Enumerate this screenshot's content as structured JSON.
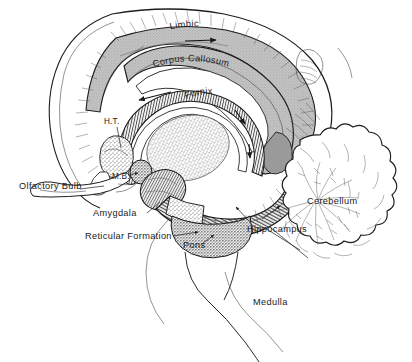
{
  "figure": {
    "background_color": "#ffffff",
    "ink_color": "#1a1a1a",
    "shade_color": "#b9b9b9",
    "width": 412,
    "height": 362
  },
  "labels": {
    "limbic": "Limbic",
    "corpus_callosum": "Corpus Callosum",
    "fornix": "Fornix",
    "ht": "H.T.",
    "mb": "M.B.",
    "olfactory_bulb": "Olfactory Bulb",
    "amygdala": "Amygdala",
    "reticular_formation": "Reticular Formation",
    "pons": "Pons",
    "hippocampus": "Hippocampus",
    "cerebellum": "Cerebellum",
    "medulla": "Medulla"
  },
  "structures": [
    {
      "id": "limbic",
      "name": "Limbic",
      "kind": "cingulate-gyrus-band",
      "shading": "gray-band-with-hatching"
    },
    {
      "id": "corpus_callosum",
      "name": "Corpus Callosum",
      "kind": "arc-band",
      "shading": "gray-stippled"
    },
    {
      "id": "fornix",
      "name": "Fornix",
      "kind": "arched-tract",
      "shading": "cross-hatched",
      "flow_arrows": 3
    },
    {
      "id": "ht",
      "name": "H.T.",
      "kind": "hypothalamus",
      "shading": "stippled"
    },
    {
      "id": "mb",
      "name": "M.B.",
      "kind": "mammillary-body",
      "shading": "dark-stippled"
    },
    {
      "id": "olfactory_bulb",
      "name": "Olfactory Bulb",
      "kind": "elongated-bulb",
      "shading": "outline"
    },
    {
      "id": "amygdala",
      "name": "Amygdala",
      "kind": "ovoid-nucleus",
      "shading": "hatched"
    },
    {
      "id": "reticular_formation",
      "name": "Reticular Formation",
      "kind": "brainstem-core",
      "shading": "stippled"
    },
    {
      "id": "pons",
      "name": "Pons",
      "kind": "brainstem-bulge",
      "shading": "dense-stipple"
    },
    {
      "id": "hippocampus",
      "name": "Hippocampus",
      "kind": "curved-tract",
      "shading": "ribbed-hatching"
    },
    {
      "id": "cerebellum",
      "name": "Cerebellum",
      "kind": "lobulated-mass",
      "shading": "arbor-vitae-branching"
    },
    {
      "id": "medulla",
      "name": "Medulla",
      "kind": "brainstem-stalk",
      "shading": "outline"
    },
    {
      "id": "thalamus",
      "name": "",
      "kind": "stippled-oval",
      "shading": "stippled"
    }
  ],
  "leader_lines": [
    {
      "from": "ht",
      "direction": "down-right"
    },
    {
      "from": "mb",
      "direction": "right-arrow"
    },
    {
      "from": "olfactory_bulb",
      "direction": "right"
    },
    {
      "from": "amygdala",
      "direction": "up-right"
    },
    {
      "from": "reticular_formation",
      "direction": "right-arrow"
    },
    {
      "from": "pons",
      "direction": "up-right-arrow"
    },
    {
      "from": "hippocampus",
      "direction": "up-left-arrow"
    },
    {
      "from": "cerebellum",
      "direction": "none"
    },
    {
      "from": "medulla",
      "direction": "none"
    }
  ]
}
